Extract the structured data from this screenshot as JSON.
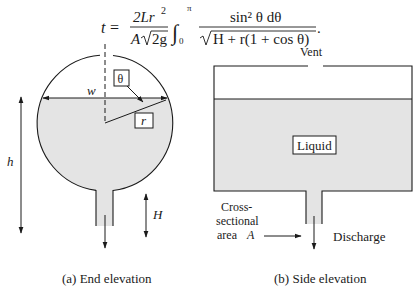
{
  "equation": {
    "lhs": "t",
    "equals": "=",
    "numerator": "2Lr",
    "numerator_exp": "2",
    "denominator_A": "A",
    "denominator_root": "2g",
    "integral_upper": "π",
    "integral_lower": "0",
    "integrand_num": "sin² θ dθ",
    "integrand_den": "H + r(1 + cos θ)",
    "period": "."
  },
  "end_elevation": {
    "caption": "(a) End elevation",
    "labels": {
      "theta": "θ",
      "w": "w",
      "r": "r",
      "h": "h",
      "H": "H"
    }
  },
  "side_elevation": {
    "caption": "(b) Side elevation",
    "labels": {
      "vent": "Vent",
      "liquid": "Liquid",
      "cross_line1": "Cross-",
      "cross_line2": "sectional",
      "cross_line3": "area",
      "cross_A": "A",
      "discharge": "Discharge"
    }
  },
  "colors": {
    "liquid_fill": "#e4e4e4",
    "stroke": "#1a1a1a",
    "background": "#ffffff"
  }
}
